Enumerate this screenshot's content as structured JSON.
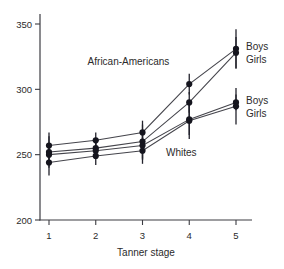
{
  "figure": {
    "background": "#ffffff"
  },
  "chart_data": {
    "type": "line",
    "title": "",
    "xlabel": "Tanner stage",
    "ylabel": "",
    "x": [
      1,
      2,
      3,
      4,
      5
    ],
    "x_ticks": [
      "1",
      "2",
      "3",
      "4",
      "5"
    ],
    "y_ticks": [
      "200",
      "250",
      "300",
      "350"
    ],
    "y_tick_values": [
      200,
      250,
      300,
      350
    ],
    "ylim": [
      200,
      350
    ],
    "xlim": [
      1,
      5
    ],
    "grid": false,
    "legend_position": "right-annotated",
    "series": [
      {
        "name": "African-American Boys",
        "group": "African-Americans",
        "label": "Boys",
        "values": [
          257,
          261,
          267,
          304,
          331
        ],
        "err": [
          10,
          6,
          9,
          8,
          15
        ]
      },
      {
        "name": "African-American Girls",
        "group": "African-Americans",
        "label": "Girls",
        "values": [
          252,
          255,
          260,
          290,
          328
        ],
        "err": [
          12,
          7,
          13,
          8,
          12
        ]
      },
      {
        "name": "White Boys",
        "group": "Whites",
        "label": "Boys",
        "values": [
          250,
          253,
          257,
          277,
          290
        ],
        "err": [
          8,
          6,
          11,
          12,
          6
        ]
      },
      {
        "name": "White Girls",
        "group": "Whites",
        "label": "Girls",
        "values": [
          244,
          249,
          253,
          276,
          287
        ],
        "err": [
          10,
          7,
          10,
          14,
          14
        ]
      }
    ],
    "annotations": [
      {
        "text": "African-Americans",
        "x": 2.7,
        "y": 321
      },
      {
        "text": "Whites",
        "x": 3.83,
        "y": 252
      }
    ],
    "group_labels": [
      {
        "group": "African-Americans",
        "labels": [
          "Boys",
          "Girls"
        ],
        "series": [
          0,
          1
        ]
      },
      {
        "group": "Whites",
        "labels": [
          "Boys",
          "Girls"
        ],
        "series": [
          2,
          3
        ]
      }
    ],
    "colors": {
      "line": "#45454c",
      "marker": "#15151e",
      "error_bar": "#22222c",
      "axis": "#3c3c42",
      "text": "#2b2b2b"
    }
  }
}
